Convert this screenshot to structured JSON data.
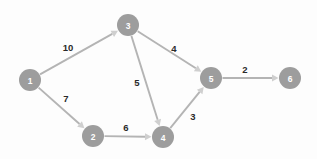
{
  "canvas": {
    "width": 317,
    "height": 159,
    "background_color": "#fdfdfd"
  },
  "chart_data": {
    "type": "diagram",
    "diagram_kind": "directed-weighted-graph",
    "title": "",
    "xlabel": "",
    "ylabel": "",
    "node_color": "#9d9d9d",
    "node_label_color": "#ffffff",
    "edge_color": "#b4b4b4",
    "arrow_color": "#cfcfcf",
    "edge_label_color": "#2a2a2a",
    "node_radius": 11,
    "nodes": [
      {
        "id": "1",
        "label": "1",
        "x": 30,
        "y": 80
      },
      {
        "id": "2",
        "label": "2",
        "x": 93,
        "y": 136
      },
      {
        "id": "3",
        "label": "3",
        "x": 128,
        "y": 25
      },
      {
        "id": "4",
        "label": "4",
        "x": 163,
        "y": 137
      },
      {
        "id": "5",
        "label": "5",
        "x": 211,
        "y": 78
      },
      {
        "id": "6",
        "label": "6",
        "x": 290,
        "y": 78
      }
    ],
    "edges": [
      {
        "from": "1",
        "to": "3",
        "weight": 10,
        "label": "10",
        "label_x": 68,
        "label_y": 47,
        "directed": true
      },
      {
        "from": "1",
        "to": "2",
        "weight": 7,
        "label": "7",
        "label_x": 66,
        "label_y": 98,
        "directed": true
      },
      {
        "from": "2",
        "to": "4",
        "weight": 6,
        "label": "6",
        "label_x": 126,
        "label_y": 127,
        "directed": true
      },
      {
        "from": "3",
        "to": "4",
        "weight": 5,
        "label": "5",
        "label_x": 137,
        "label_y": 82,
        "directed": true
      },
      {
        "from": "3",
        "to": "5",
        "weight": 4,
        "label": "4",
        "label_x": 174,
        "label_y": 48,
        "directed": true
      },
      {
        "from": "4",
        "to": "5",
        "weight": 3,
        "label": "3",
        "label_x": 193,
        "label_y": 116,
        "directed": true
      },
      {
        "from": "5",
        "to": "6",
        "weight": 2,
        "label": "2",
        "label_x": 245,
        "label_y": 69,
        "directed": true
      }
    ]
  }
}
